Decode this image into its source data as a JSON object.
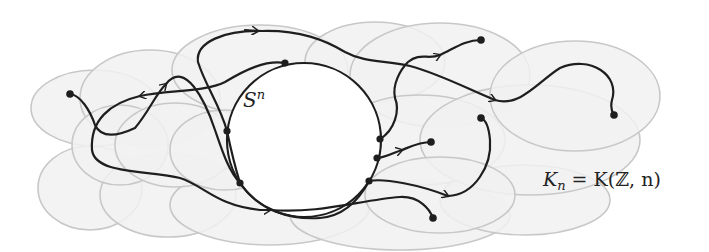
{
  "figure": {
    "labels": {
      "sphere": "S",
      "sphere_sup": "n",
      "space_lhs": "K",
      "space_lhs_sub": "n",
      "space_eq": " = K(",
      "space_ring": "ℤ",
      "space_tail": ", n)"
    },
    "colors": {
      "background": "#ffffff",
      "ellipse_fill": "#f1f1f1",
      "ellipse_stroke": "#c8c8c8",
      "path_stroke": "#1e1e1e",
      "circle_fill": "#ffffff"
    },
    "sphere": {
      "cx": 304,
      "cy": 140,
      "r": 77
    },
    "circle_points": [
      [
        285,
        63
      ],
      [
        227,
        131
      ],
      [
        240,
        183
      ],
      [
        380,
        139
      ],
      [
        377,
        158
      ],
      [
        369,
        181
      ]
    ],
    "endpoints": [
      [
        70,
        94
      ],
      [
        481,
        40
      ],
      [
        614,
        115
      ],
      [
        431,
        142
      ],
      [
        481,
        118
      ],
      [
        433,
        218
      ]
    ]
  }
}
